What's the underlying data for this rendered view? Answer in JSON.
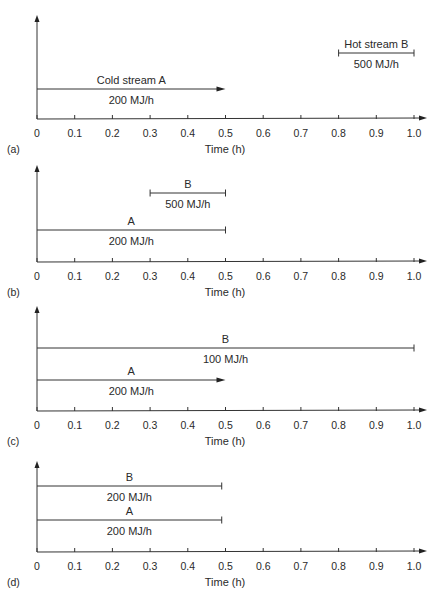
{
  "chart_data": [
    {
      "type": "timeline",
      "panel_label": "(a)",
      "xlabel": "Time (h)",
      "xlim": [
        0,
        1.0
      ],
      "x_ticks": [
        "0",
        "0.1",
        "0.2",
        "0.3",
        "0.4",
        "0.5",
        "0.6",
        "0.7",
        "0.8",
        "0.9",
        "1.0"
      ],
      "streams": [
        {
          "name": "Cold stream A",
          "label_above": "Cold stream A",
          "label_below": "200 MJ/h",
          "start": 0,
          "end": 0.5,
          "rate_MJ_per_h": 200,
          "end_style": "arrow",
          "level": 1
        },
        {
          "name": "Hot stream B",
          "label_above": "Hot stream B",
          "label_below": "500 MJ/h",
          "start": 0.8,
          "end": 1.0,
          "rate_MJ_per_h": 500,
          "end_style": "bar",
          "level": 2
        }
      ]
    },
    {
      "type": "timeline",
      "panel_label": "(b)",
      "xlabel": "Time (h)",
      "xlim": [
        0,
        1.0
      ],
      "x_ticks": [
        "0",
        "0.1",
        "0.2",
        "0.3",
        "0.4",
        "0.5",
        "0.6",
        "0.7",
        "0.8",
        "0.9",
        "1.0"
      ],
      "streams": [
        {
          "name": "A",
          "label_above": "A",
          "label_below": "200 MJ/h",
          "start": 0,
          "end": 0.5,
          "rate_MJ_per_h": 200,
          "end_style": "bar",
          "level": 1
        },
        {
          "name": "B",
          "label_above": "B",
          "label_below": "500 MJ/h",
          "start": 0.3,
          "end": 0.5,
          "rate_MJ_per_h": 500,
          "end_style": "bar",
          "level": 2
        }
      ]
    },
    {
      "type": "timeline",
      "panel_label": "(c)",
      "xlabel": "Time (h)",
      "xlim": [
        0,
        1.0
      ],
      "x_ticks": [
        "0",
        "0.1",
        "0.2",
        "0.3",
        "0.4",
        "0.5",
        "0.6",
        "0.7",
        "0.8",
        "0.9",
        "1.0"
      ],
      "streams": [
        {
          "name": "A",
          "label_above": "A",
          "label_below": "200 MJ/h",
          "start": 0,
          "end": 0.5,
          "rate_MJ_per_h": 200,
          "end_style": "arrow",
          "level": 1
        },
        {
          "name": "B",
          "label_above": "B",
          "label_below": "100 MJ/h",
          "start": 0,
          "end": 1.0,
          "rate_MJ_per_h": 100,
          "end_style": "bar",
          "level": 2
        }
      ]
    },
    {
      "type": "timeline",
      "panel_label": "(d)",
      "xlabel": "Time (h)",
      "xlim": [
        0,
        1.0
      ],
      "x_ticks": [
        "0",
        "0.1",
        "0.2",
        "0.3",
        "0.4",
        "0.5",
        "0.6",
        "0.7",
        "0.8",
        "0.9",
        "1.0"
      ],
      "streams": [
        {
          "name": "A",
          "label_above": "A",
          "label_below": "200 MJ/h",
          "start": 0,
          "end": 0.49,
          "rate_MJ_per_h": 200,
          "end_style": "bar",
          "level": 1
        },
        {
          "name": "B",
          "label_above": "B",
          "label_below": "200 MJ/h",
          "start": 0,
          "end": 0.49,
          "rate_MJ_per_h": 200,
          "end_style": "bar",
          "level": 2
        }
      ]
    }
  ]
}
